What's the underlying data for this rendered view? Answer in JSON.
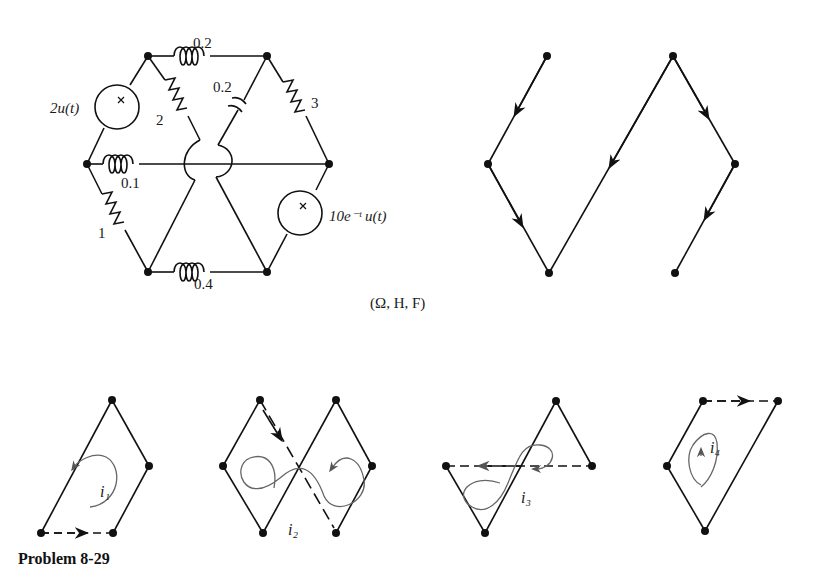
{
  "circuit": {
    "inductor_top": "0.2",
    "capacitor": "0.2",
    "resistor_right": "3",
    "resistor_diag": "2",
    "inductor_mid": "0.1",
    "resistor_left": "1",
    "inductor_bottom": "0.4",
    "source_left": "2u(t)",
    "source_right": "10e⁻ᵗ u(t)",
    "units": "(Ω, H, F)"
  },
  "tree_graph": {
    "description": "Tree with directed branches"
  },
  "loops": [
    {
      "label": "i₁"
    },
    {
      "label": "i₂"
    },
    {
      "label": "i₃"
    },
    {
      "label": "i₄"
    }
  ],
  "caption": "Problem 8-29"
}
